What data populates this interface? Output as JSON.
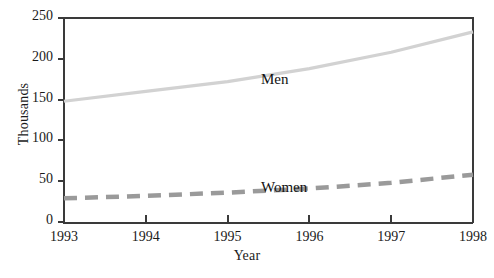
{
  "chart_data": {
    "type": "line",
    "title": "",
    "xlabel": "Year",
    "ylabel": "Thousands",
    "x": [
      1993,
      1994,
      1995,
      1996,
      1997,
      1998
    ],
    "categories": [
      "1993",
      "1994",
      "1995",
      "1996",
      "1997",
      "1998"
    ],
    "xlim": [
      1993,
      1998
    ],
    "ylim": [
      0,
      250
    ],
    "yticks": [
      0,
      50,
      100,
      150,
      200,
      250
    ],
    "ytick_labels": [
      "0",
      "50",
      "100",
      "150",
      "200",
      "250"
    ],
    "xticks": [
      1993,
      1994,
      1995,
      1996,
      1997,
      1998
    ],
    "xtick_labels": [
      "1993",
      "1994",
      "1995",
      "1996",
      "1997",
      "1998"
    ],
    "grid": false,
    "legend_position": "inline-annotations",
    "series": [
      {
        "name": "Men",
        "label": "Men",
        "color": "#d2d2d2",
        "style": "solid",
        "values": [
          148,
          160,
          172,
          188,
          208,
          233
        ]
      },
      {
        "name": "Women",
        "label": "Women",
        "color": "#9a9a9a",
        "style": "dashed",
        "values": [
          29,
          32,
          36,
          41,
          48,
          58
        ]
      }
    ],
    "annotations": [
      {
        "text": "Men",
        "x": 1995.0,
        "y": 200
      },
      {
        "text": "Women",
        "x": 1995.0,
        "y": 68
      }
    ]
  },
  "axis": {
    "y_title": "Thousands",
    "x_title": "Year",
    "frame_color": "#3a3a3a"
  }
}
